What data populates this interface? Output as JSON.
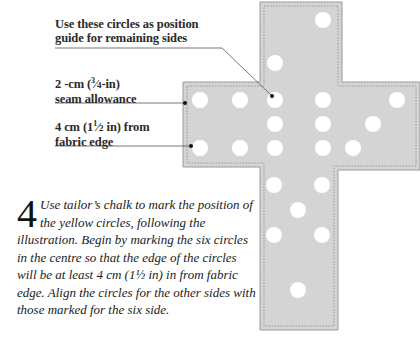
{
  "labels": {
    "position_guide": {
      "line1": "Use these circles as position",
      "line2": "guide for remaining sides"
    },
    "seam_allowance": {
      "line1_prefix": "2 -cm (",
      "frac_num": "3",
      "frac_den": "4",
      "line1_suffix": "-in)",
      "line2": "seam allowance"
    },
    "fabric_edge": {
      "line1_prefix": "4 cm (1",
      "frac_num": "1",
      "frac_den": "2",
      "line1_suffix": " in) from",
      "line2": "fabric edge"
    }
  },
  "step": {
    "number": "4",
    "text": "Use tailor’s chalk to mark the position of the yellow circles, following the illustration. Begin by marking the six circles in the centre so that the edge of the circles will be at least 4 cm (1½ in) in from fabric edge. Align the circles for the other sides with those marked for the six side."
  },
  "figure": {
    "fabric_color": "#d4d4d4",
    "edge_color": "#9a9a9a",
    "stitch_color": "#8a8a8a",
    "circle_color": "#ffffff",
    "leader_color": "#555555",
    "circles": [
      [
        323,
        20
      ],
      [
        275,
        63
      ],
      [
        200,
        100
      ],
      [
        240,
        100
      ],
      [
        275,
        100
      ],
      [
        323,
        100
      ],
      [
        397,
        100
      ],
      [
        275,
        124
      ],
      [
        323,
        124
      ],
      [
        373,
        124
      ],
      [
        200,
        148
      ],
      [
        240,
        148
      ],
      [
        275,
        148
      ],
      [
        323,
        148
      ],
      [
        353,
        148
      ],
      [
        274,
        185
      ],
      [
        322,
        185
      ],
      [
        298,
        210
      ],
      [
        274,
        235
      ],
      [
        322,
        235
      ],
      [
        298,
        290
      ]
    ]
  }
}
